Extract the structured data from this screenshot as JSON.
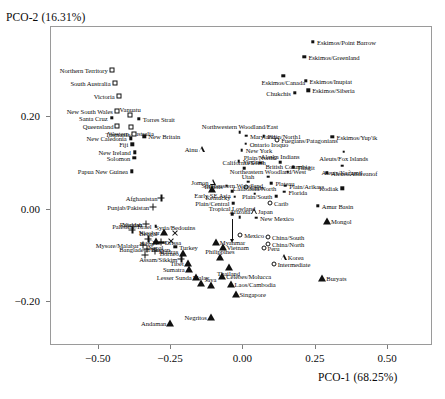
{
  "chart_data": {
    "type": "scatter",
    "title": "",
    "xlabel": "PCO-1 (68.25%)",
    "ylabel": "PCO-2 (16.31%)",
    "xticks": [
      -0.5,
      -0.25,
      0.0,
      0.25,
      0.5
    ],
    "xticklabels": [
      "−0.50",
      "−0.25",
      "0.00",
      "0.25",
      "0.50"
    ],
    "yticks": [
      0.2,
      0.0,
      -0.2
    ],
    "yticklabels": [
      "0.20",
      "0.00",
      "−0.20"
    ],
    "xlim": [
      -0.665,
      0.655
    ],
    "ylim": [
      -0.295,
      0.395
    ],
    "grid": false,
    "legend": "none",
    "marker_types": {
      "dot": "small-filled-dot",
      "fsq": "small-filled-square",
      "osq": "open-square",
      "ocir": "open-circle",
      "ftri": "filled-triangle",
      "otri": "open-triangle",
      "plus": "plus-cross",
      "x": "x-cross"
    },
    "points": [
      {
        "label": "Northern Territory",
        "x": -0.452,
        "y": 0.299,
        "m": "osq",
        "lp": "r"
      },
      {
        "label": "South Australia",
        "x": -0.442,
        "y": 0.271,
        "m": "osq",
        "lp": "r"
      },
      {
        "label": "Victoria",
        "x": -0.428,
        "y": 0.243,
        "m": "osq",
        "lp": "r"
      },
      {
        "label": "New South Wales",
        "x": -0.434,
        "y": 0.212,
        "m": "osq",
        "lp": "r"
      },
      {
        "label": "Santa Cruz",
        "x": -0.452,
        "y": 0.196,
        "m": "fsq",
        "lp": "r"
      },
      {
        "label": "Queensland",
        "x": -0.432,
        "y": 0.178,
        "m": "osq",
        "lp": "r"
      },
      {
        "label": "Vanuatu",
        "x": -0.388,
        "y": 0.202,
        "m": "osq",
        "lp": "t"
      },
      {
        "label": "Torres Strait",
        "x": -0.358,
        "y": 0.194,
        "m": "fsq",
        "lp": "l"
      },
      {
        "label": "Western Australia",
        "x": -0.386,
        "y": 0.176,
        "m": "osq",
        "lp": "b"
      },
      {
        "label": "Tasmania",
        "x": -0.374,
        "y": 0.161,
        "m": "osq",
        "lp": "r"
      },
      {
        "label": "New Caledonia",
        "x": -0.386,
        "y": 0.152,
        "m": "fsq",
        "lp": "r"
      },
      {
        "label": "New Britain",
        "x": -0.339,
        "y": 0.156,
        "m": "fsq",
        "lp": "l"
      },
      {
        "label": "Fiji",
        "x": -0.381,
        "y": 0.139,
        "m": "fsq",
        "lp": "r"
      },
      {
        "label": "New Ireland",
        "x": -0.372,
        "y": 0.122,
        "m": "fsq",
        "lp": "r"
      },
      {
        "label": "Solomon",
        "x": -0.374,
        "y": 0.11,
        "m": "fsq",
        "lp": "r"
      },
      {
        "label": "Papua New Guinea",
        "x": -0.382,
        "y": 0.081,
        "m": "fsq",
        "lp": "r"
      },
      {
        "label": "Eskimos/Point Barrow",
        "x": 0.244,
        "y": 0.361,
        "m": "fsq",
        "lp": "l"
      },
      {
        "label": "Eskimos/Greenland",
        "x": 0.214,
        "y": 0.329,
        "m": "fsq",
        "lp": "l"
      },
      {
        "label": "Eskimos/Canada",
        "x": 0.141,
        "y": 0.287,
        "m": "fsq",
        "lp": "b"
      },
      {
        "label": "Eskimos/Inupiat",
        "x": 0.218,
        "y": 0.276,
        "m": "fsq",
        "lp": "l"
      },
      {
        "label": "Eskimos/Siberia",
        "x": 0.227,
        "y": 0.256,
        "m": "fsq",
        "lp": "l"
      },
      {
        "label": "Chukchis",
        "x": 0.181,
        "y": 0.251,
        "m": "fsq",
        "lp": "r"
      },
      {
        "label": "Northwestern Woodland/East",
        "x": -0.009,
        "y": 0.165,
        "m": "dot",
        "lp": "t"
      },
      {
        "label": "Maryland",
        "x": 0.012,
        "y": 0.158,
        "m": "dot",
        "lp": "l"
      },
      {
        "label": "Plain/North1",
        "x": 0.073,
        "y": 0.157,
        "m": "dot",
        "lp": "l"
      },
      {
        "label": "Fuegians/Patagonians",
        "x": 0.12,
        "y": 0.148,
        "m": "ocir",
        "lp": "l"
      },
      {
        "label": "Eskimos/Yup'ik",
        "x": 0.311,
        "y": 0.155,
        "m": "fsq",
        "lp": "l"
      },
      {
        "label": "Ontario Iroquo",
        "x": 0.011,
        "y": 0.14,
        "m": "dot",
        "lp": "l"
      },
      {
        "label": "Ainu",
        "x": -0.141,
        "y": 0.128,
        "m": "otri",
        "lp": "r"
      },
      {
        "label": "New York",
        "x": -0.002,
        "y": 0.126,
        "m": "dot",
        "lp": "l"
      },
      {
        "label": "Aleuts/Fox Islands",
        "x": 0.35,
        "y": 0.123,
        "m": "dot",
        "lp": "b"
      },
      {
        "label": "Virginia",
        "x": -0.013,
        "y": 0.103,
        "m": "dot",
        "lp": "l"
      },
      {
        "label": "Plain/North2",
        "x": 0.062,
        "y": 0.099,
        "m": "dot",
        "lp": "t"
      },
      {
        "label": "Alaska Indians",
        "x": 0.13,
        "y": 0.1,
        "m": "dot",
        "lp": "t"
      },
      {
        "label": "Tlingit",
        "x": 0.175,
        "y": 0.089,
        "m": "dot",
        "lp": "l"
      },
      {
        "label": "Aleuts/Kağamil",
        "x": 0.344,
        "y": 0.093,
        "m": "dot",
        "lp": "b"
      },
      {
        "label": "California/South",
        "x": 0.006,
        "y": 0.087,
        "m": "dot",
        "lp": "t"
      },
      {
        "label": "British Columbia",
        "x": 0.157,
        "y": 0.08,
        "m": "dot",
        "lp": "t"
      },
      {
        "label": "Northeastern Woodland/West",
        "x": 0.088,
        "y": 0.069,
        "m": "dot",
        "lp": "t"
      },
      {
        "label": "Aleuts/Andreanof",
        "x": 0.292,
        "y": 0.077,
        "m": "fsq",
        "lp": "l"
      },
      {
        "label": "Jomon",
        "x": -0.103,
        "y": 0.058,
        "m": "otri",
        "lp": "r"
      },
      {
        "label": "Utah",
        "x": 0.019,
        "y": 0.058,
        "m": "dot",
        "lp": "t"
      },
      {
        "label": "Plateau",
        "x": 0.1,
        "y": 0.055,
        "m": "dot",
        "lp": "l"
      },
      {
        "label": "Illinois",
        "x": -0.054,
        "y": 0.05,
        "m": "dot",
        "lp": "r"
      },
      {
        "label": "Plain/Arikara",
        "x": 0.148,
        "y": 0.05,
        "m": "dot",
        "lp": "l"
      },
      {
        "label": "Kodiak",
        "x": 0.345,
        "y": 0.044,
        "m": "fsq",
        "lp": "r"
      },
      {
        "label": "Chile",
        "x": 0.012,
        "y": 0.046,
        "m": "ocir",
        "lp": "l"
      },
      {
        "label": "Early SE Asia",
        "x": -0.104,
        "y": 0.042,
        "m": "ftri",
        "lp": "b"
      },
      {
        "label": "Southeastern Woodland",
        "x": -0.035,
        "y": 0.038,
        "m": "dot",
        "lp": "t"
      },
      {
        "label": "California/North",
        "x": 0.042,
        "y": 0.032,
        "m": "dot",
        "lp": "t"
      },
      {
        "label": "Florida",
        "x": 0.145,
        "y": 0.037,
        "m": "dot",
        "lp": "l"
      },
      {
        "label": "Plain/South",
        "x": 0.117,
        "y": 0.027,
        "m": "dot",
        "lp": "r"
      },
      {
        "label": "Kentucky",
        "x": -0.027,
        "y": 0.026,
        "m": "dot",
        "lp": "r"
      },
      {
        "label": "Afghanistan",
        "x": -0.28,
        "y": 0.024,
        "m": "plus",
        "lp": "r"
      },
      {
        "label": "Plain/Central",
        "x": -0.031,
        "y": 0.012,
        "m": "dot",
        "lp": "r"
      },
      {
        "label": "Carib",
        "x": 0.095,
        "y": 0.012,
        "m": "ocir",
        "lp": "l"
      },
      {
        "label": "Amur Basin",
        "x": 0.26,
        "y": 0.006,
        "m": "fsq",
        "lp": "l"
      },
      {
        "label": "Punjab/Pakistan",
        "x": -0.309,
        "y": 0.003,
        "m": "plus",
        "lp": "r"
      },
      {
        "label": "Japan",
        "x": 0.04,
        "y": -0.005,
        "m": "otri",
        "lp": "l"
      },
      {
        "label": "Tropical Lowland",
        "x": -0.036,
        "y": -0.012,
        "m": "dot",
        "lp": "t"
      },
      {
        "label": "Mongol",
        "x": 0.292,
        "y": -0.027,
        "m": "ftri",
        "lp": "l"
      },
      {
        "label": "Arizona",
        "x": -0.009,
        "y": -0.018,
        "m": "dot",
        "lp": "t"
      },
      {
        "label": "New Mexico",
        "x": 0.047,
        "y": -0.02,
        "m": "dot",
        "lp": "l"
      },
      {
        "label": "Rajastan",
        "x": -0.333,
        "y": -0.033,
        "m": "plus",
        "lp": "r"
      },
      {
        "label": "Palestine/Israel",
        "x": -0.3,
        "y": -0.038,
        "m": "dot",
        "lp": "r"
      },
      {
        "label": "Voddah",
        "x": -0.38,
        "y": -0.046,
        "m": "plus",
        "lp": "t"
      },
      {
        "label": "Nicobar",
        "x": -0.272,
        "y": -0.05,
        "m": "ftri",
        "lp": "r"
      },
      {
        "label": "Syria/Bedouins",
        "x": -0.232,
        "y": -0.052,
        "m": "x",
        "lp": "t"
      },
      {
        "label": "Mexico",
        "x": -0.008,
        "y": -0.056,
        "m": "ocir",
        "lp": "l"
      },
      {
        "label": "China/South",
        "x": 0.088,
        "y": -0.062,
        "m": "ocir",
        "lp": "l"
      },
      {
        "label": "Bengal",
        "x": -0.325,
        "y": -0.066,
        "m": "plus",
        "lp": "t"
      },
      {
        "label": "Nepal",
        "x": -0.3,
        "y": -0.071,
        "m": "ftri",
        "lp": "b"
      },
      {
        "label": "Orissa",
        "x": -0.283,
        "y": -0.073,
        "m": "plus",
        "lp": "l"
      },
      {
        "label": "Cyprus",
        "x": -0.247,
        "y": -0.07,
        "m": "x",
        "lp": "r"
      },
      {
        "label": "China/North",
        "x": 0.088,
        "y": -0.077,
        "m": "ocir",
        "lp": "l"
      },
      {
        "label": "Mysore/Malabar",
        "x": -0.344,
        "y": -0.078,
        "m": "plus",
        "lp": "r"
      },
      {
        "label": "Myanmar",
        "x": -0.092,
        "y": -0.073,
        "m": "ftri",
        "lp": "l"
      },
      {
        "label": "Bihar",
        "x": -0.33,
        "y": -0.088,
        "m": "plus",
        "lp": "t"
      },
      {
        "label": "Madras",
        "x": -0.303,
        "y": -0.091,
        "m": "plus",
        "lp": "l"
      },
      {
        "label": "Turkey",
        "x": -0.232,
        "y": -0.082,
        "m": "fsq",
        "lp": "l"
      },
      {
        "label": "Vietnam",
        "x": -0.068,
        "y": -0.083,
        "m": "ftri",
        "lp": "l"
      },
      {
        "label": "Peru",
        "x": 0.073,
        "y": -0.086,
        "m": "ocir",
        "lp": "l"
      },
      {
        "label": "Bangladesh/Bhutan",
        "x": -0.338,
        "y": -0.1,
        "m": "plus",
        "lp": "t"
      },
      {
        "label": "Borneo",
        "x": -0.206,
        "y": -0.096,
        "m": "ftri",
        "lp": "r"
      },
      {
        "label": "Assam/Sikkim",
        "x": -0.211,
        "y": -0.108,
        "m": "plus",
        "lp": "r"
      },
      {
        "label": "Philippines",
        "x": -0.078,
        "y": -0.105,
        "m": "ftri",
        "lp": "t"
      },
      {
        "label": "Korea",
        "x": 0.143,
        "y": -0.105,
        "m": "otri",
        "lp": "l"
      },
      {
        "label": "Tibet",
        "x": -0.189,
        "y": -0.118,
        "m": "ftri",
        "lp": "r"
      },
      {
        "label": "Intermediate",
        "x": 0.108,
        "y": -0.12,
        "m": "ocir",
        "lp": "l"
      },
      {
        "label": "Sumatra",
        "x": -0.186,
        "y": -0.13,
        "m": "ftri",
        "lp": "r"
      },
      {
        "label": "Thailand",
        "x": -0.048,
        "y": -0.126,
        "m": "ftri",
        "lp": "b"
      },
      {
        "label": "Lesser Sunda",
        "x": -0.162,
        "y": -0.148,
        "m": "ftri",
        "lp": "r"
      },
      {
        "label": "Celebes/Molucca",
        "x": -0.07,
        "y": -0.145,
        "m": "ftri",
        "lp": "l"
      },
      {
        "label": "Malay",
        "x": -0.143,
        "y": -0.16,
        "m": "ftri",
        "lp": "t"
      },
      {
        "label": "Java",
        "x": -0.11,
        "y": -0.166,
        "m": "ftri",
        "lp": "t"
      },
      {
        "label": "Laos/Cambodia",
        "x": -0.041,
        "y": -0.162,
        "m": "ftri",
        "lp": "l"
      },
      {
        "label": "Buryats",
        "x": 0.276,
        "y": -0.151,
        "m": "ftri",
        "lp": "l"
      },
      {
        "label": "Singapore",
        "x": -0.024,
        "y": -0.184,
        "m": "ftri",
        "lp": "l"
      },
      {
        "label": "Negritos",
        "x": -0.109,
        "y": -0.235,
        "m": "ftri",
        "lp": "r"
      },
      {
        "label": "Andaman",
        "x": -0.249,
        "y": -0.248,
        "m": "ftri",
        "lp": "r"
      }
    ],
    "annotations": [
      {
        "kind": "arrow",
        "from_label": "Tropical Lowland",
        "x": -0.036,
        "y1": -0.022,
        "y2": -0.066
      }
    ]
  }
}
